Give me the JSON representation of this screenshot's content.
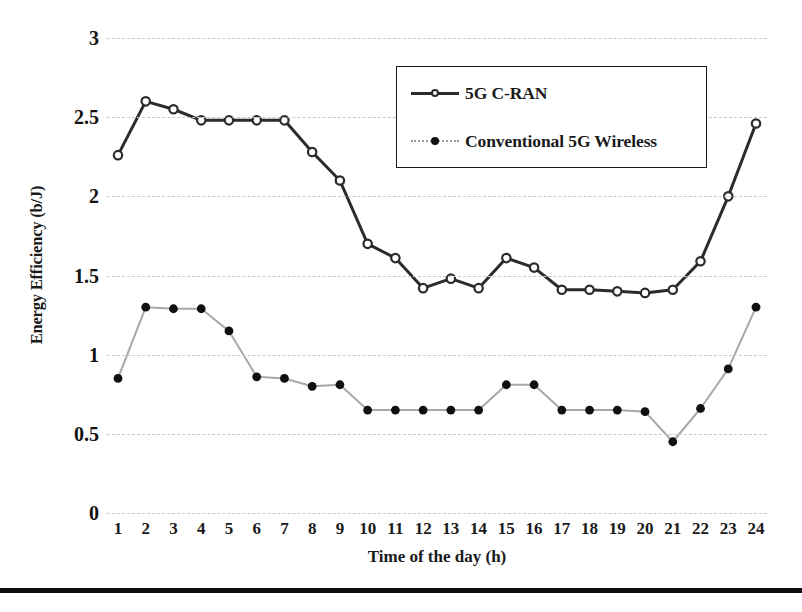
{
  "chart_data": {
    "type": "line",
    "title": "",
    "xlabel": "Time of the day (h)",
    "ylabel": "Energy Efficiency (b/J)",
    "x": [
      1,
      2,
      3,
      4,
      5,
      6,
      7,
      8,
      9,
      10,
      11,
      12,
      13,
      14,
      15,
      16,
      17,
      18,
      19,
      20,
      21,
      22,
      23,
      24
    ],
    "xtick_labels": [
      "1",
      "2",
      "3",
      "4",
      "5",
      "6",
      "7",
      "8",
      "9",
      "10",
      "11",
      "12",
      "13",
      "14",
      "15",
      "16",
      "17",
      "18",
      "19",
      "20",
      "21",
      "22",
      "23",
      "24"
    ],
    "ytick_labels": [
      "0",
      "0.5",
      "1",
      "1.5",
      "2",
      "2.5",
      "3"
    ],
    "yticks": [
      0,
      0.5,
      1,
      1.5,
      2,
      2.5,
      3
    ],
    "ylim": [
      0,
      3
    ],
    "xlim": [
      1,
      24
    ],
    "grid": true,
    "legend_position": "upper-right-inside",
    "series": [
      {
        "name": "5G C-RAN",
        "marker": "open-circle",
        "line_color": "#2b2b2b",
        "values": [
          2.26,
          2.6,
          2.55,
          2.48,
          2.48,
          2.48,
          2.48,
          2.28,
          2.1,
          1.7,
          1.61,
          1.42,
          1.48,
          1.42,
          1.61,
          1.55,
          1.41,
          1.41,
          1.4,
          1.39,
          1.41,
          1.59,
          2.0,
          2.46
        ]
      },
      {
        "name": "Conventional 5G Wireless",
        "marker": "filled-dot",
        "line_color": "#a8a8a8",
        "values": [
          0.85,
          1.3,
          1.29,
          1.29,
          1.15,
          0.86,
          0.85,
          0.8,
          0.81,
          0.65,
          0.65,
          0.65,
          0.65,
          0.65,
          0.81,
          0.81,
          0.65,
          0.65,
          0.65,
          0.64,
          0.45,
          0.66,
          0.91,
          1.3
        ]
      }
    ]
  },
  "legend": {
    "entries": [
      {
        "label": "5G C-RAN"
      },
      {
        "label": "Conventional 5G Wireless"
      }
    ]
  }
}
